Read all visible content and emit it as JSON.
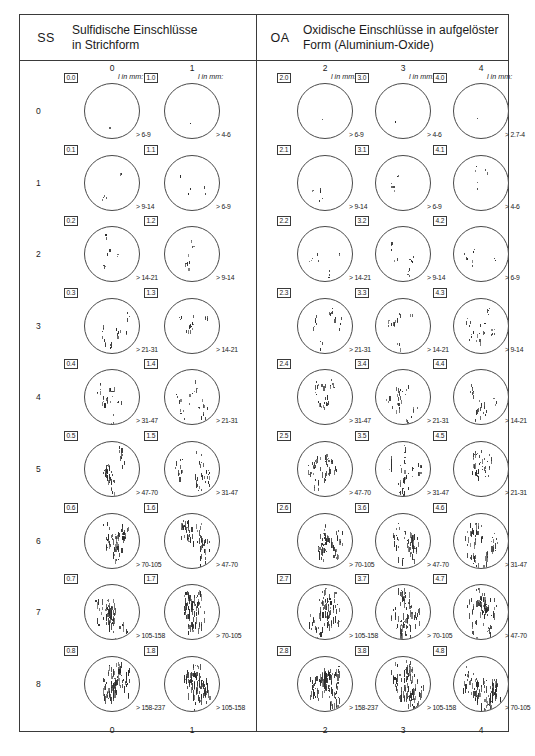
{
  "header": {
    "left": {
      "code": "SS",
      "title_line1": "Sulfidische Einschlüsse",
      "title_line2": "in Strichform"
    },
    "right": {
      "code": "OA",
      "title_line1": "Oxidische Einschlüsse in aufgelöster",
      "title_line2": "Form (Aluminium-Oxide)"
    }
  },
  "unit_label": "l in mm:",
  "panels": [
    {
      "name": "SS",
      "columns": [
        {
          "label": "0",
          "footer": "0"
        },
        {
          "label": "1",
          "footer": "1"
        }
      ],
      "rows": [
        {
          "row_label": "0",
          "cells": [
            {
              "badge": "0.0",
              "range": "> 6-9",
              "density": 0
            },
            {
              "badge": "1.0",
              "range": "> 4-6",
              "density": 0
            }
          ]
        },
        {
          "row_label": "1",
          "cells": [
            {
              "badge": "0.1",
              "range": "> 9-14",
              "density": 1
            },
            {
              "badge": "1.1",
              "range": "> 6-9",
              "density": 1
            }
          ]
        },
        {
          "row_label": "2",
          "cells": [
            {
              "badge": "0.2",
              "range": "> 14-21",
              "density": 2
            },
            {
              "badge": "1.2",
              "range": "> 9-14",
              "density": 2
            }
          ]
        },
        {
          "row_label": "3",
          "cells": [
            {
              "badge": "0.3",
              "range": "> 21-31",
              "density": 3
            },
            {
              "badge": "1.3",
              "range": "> 14-21",
              "density": 3
            }
          ]
        },
        {
          "row_label": "4",
          "cells": [
            {
              "badge": "0.4",
              "range": "> 31-47",
              "density": 4
            },
            {
              "badge": "1.4",
              "range": "> 21-31",
              "density": 4
            }
          ]
        },
        {
          "row_label": "5",
          "cells": [
            {
              "badge": "0.5",
              "range": "> 47-70",
              "density": 5
            },
            {
              "badge": "1.5",
              "range": "> 31-47",
              "density": 5
            }
          ]
        },
        {
          "row_label": "6",
          "cells": [
            {
              "badge": "0.6",
              "range": "> 70-105",
              "density": 6
            },
            {
              "badge": "1.6",
              "range": "> 47-70",
              "density": 6
            }
          ]
        },
        {
          "row_label": "7",
          "cells": [
            {
              "badge": "0.7",
              "range": "> 105-158",
              "density": 7
            },
            {
              "badge": "1.7",
              "range": "> 70-105",
              "density": 7
            }
          ]
        },
        {
          "row_label": "8",
          "cells": [
            {
              "badge": "0.8",
              "range": "> 158-237",
              "density": 8
            },
            {
              "badge": "1.8",
              "range": "> 105-158",
              "density": 8
            }
          ]
        }
      ]
    },
    {
      "name": "OA",
      "columns": [
        {
          "label": "2",
          "footer": "2"
        },
        {
          "label": "3",
          "footer": "3"
        },
        {
          "label": "4",
          "footer": "4"
        }
      ],
      "rows": [
        {
          "row_label": "",
          "cells": [
            {
              "badge": "2.0",
              "range": "> 6-9",
              "density": 0
            },
            {
              "badge": "3.0",
              "range": "> 4-6",
              "density": 0
            },
            {
              "badge": "4.0",
              "range": "> 2.7-4",
              "density": 0
            }
          ]
        },
        {
          "row_label": "",
          "cells": [
            {
              "badge": "2.1",
              "range": "> 9-14",
              "density": 1
            },
            {
              "badge": "3.1",
              "range": "> 6-9",
              "density": 1
            },
            {
              "badge": "4.1",
              "range": "> 4-6",
              "density": 1
            }
          ]
        },
        {
          "row_label": "",
          "cells": [
            {
              "badge": "2.2",
              "range": "> 14-21",
              "density": 2
            },
            {
              "badge": "3.2",
              "range": "> 9-14",
              "density": 2
            },
            {
              "badge": "4.2",
              "range": "> 6-9",
              "density": 2
            }
          ]
        },
        {
          "row_label": "",
          "cells": [
            {
              "badge": "2.3",
              "range": "> 21-31",
              "density": 3
            },
            {
              "badge": "3.3",
              "range": "> 14-21",
              "density": 3
            },
            {
              "badge": "4.3",
              "range": "> 9-14",
              "density": 3
            }
          ]
        },
        {
          "row_label": "",
          "cells": [
            {
              "badge": "2.4",
              "range": "> 31-47",
              "density": 4
            },
            {
              "badge": "3.4",
              "range": "> 21-31",
              "density": 4
            },
            {
              "badge": "4.4",
              "range": "> 14-21",
              "density": 4
            }
          ]
        },
        {
          "row_label": "",
          "cells": [
            {
              "badge": "2.5",
              "range": "> 47-70",
              "density": 5
            },
            {
              "badge": "3.5",
              "range": "> 31-47",
              "density": 5
            },
            {
              "badge": "4.5",
              "range": "> 21-31",
              "density": 5
            }
          ]
        },
        {
          "row_label": "",
          "cells": [
            {
              "badge": "2.6",
              "range": "> 70-105",
              "density": 6
            },
            {
              "badge": "3.6",
              "range": "> 47-70",
              "density": 6
            },
            {
              "badge": "4.6",
              "range": "> 31-47",
              "density": 6
            }
          ]
        },
        {
          "row_label": "",
          "cells": [
            {
              "badge": "2.7",
              "range": "> 105-158",
              "density": 7
            },
            {
              "badge": "3.7",
              "range": "> 70-105",
              "density": 7
            },
            {
              "badge": "4.7",
              "range": "> 47-70",
              "density": 7
            }
          ]
        },
        {
          "row_label": "",
          "cells": [
            {
              "badge": "2.8",
              "range": "> 158-237",
              "density": 8
            },
            {
              "badge": "3.8",
              "range": "> 105-158",
              "density": 8
            },
            {
              "badge": "4.8",
              "range": "> 70-105",
              "density": 8
            }
          ]
        }
      ]
    }
  ],
  "colors": {
    "border": "#3a3a3a",
    "disc": "#4a4a4a",
    "mark": "#2b2b2b",
    "text": "#1a1a1a"
  }
}
